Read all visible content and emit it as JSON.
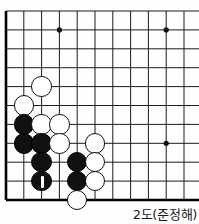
{
  "diagram": {
    "kind": "go-board-problem-diagram",
    "caption": "2도(준정해)",
    "board": {
      "size": 19,
      "visible_columns": 11,
      "visible_rows": 11,
      "origin": "top-left-corner-of-board",
      "edges": [
        "left",
        "bottom"
      ],
      "line_color": "#1a1a1a",
      "edge_color": "#000000",
      "background_color": "#fefefe",
      "geometry": {
        "left_edge_x": 6,
        "top_line_y": 11,
        "col_spacing": 17.8,
        "row_spacing": 18.9,
        "stone_diameter": 20.5
      },
      "star_points": [
        {
          "col": 4,
          "row": 2
        },
        {
          "col": 10,
          "row": 2
        },
        {
          "col": 10,
          "row": 8
        }
      ]
    },
    "stones": [
      {
        "color": "white",
        "col": 3,
        "row": 5,
        "label": ""
      },
      {
        "color": "white",
        "col": 2,
        "row": 6,
        "label": ""
      },
      {
        "color": "black",
        "col": 2,
        "row": 7,
        "label": ""
      },
      {
        "color": "white",
        "col": 3,
        "row": 7,
        "label": ""
      },
      {
        "color": "white",
        "col": 4,
        "row": 7,
        "label": ""
      },
      {
        "color": "black",
        "col": 2,
        "row": 8,
        "label": ""
      },
      {
        "color": "black",
        "col": 3,
        "row": 8,
        "label": ""
      },
      {
        "color": "white",
        "col": 4,
        "row": 8,
        "label": ""
      },
      {
        "color": "white",
        "col": 6,
        "row": 8,
        "label": ""
      },
      {
        "color": "black",
        "col": 3,
        "row": 9,
        "label": ""
      },
      {
        "color": "black",
        "col": 5,
        "row": 9,
        "label": ""
      },
      {
        "color": "white",
        "col": 6,
        "row": 9,
        "label": ""
      },
      {
        "color": "black",
        "col": 3,
        "row": 10,
        "label": "1"
      },
      {
        "color": "black",
        "col": 5,
        "row": 10,
        "label": ""
      },
      {
        "color": "white",
        "col": 6,
        "row": 10,
        "label": ""
      },
      {
        "color": "white",
        "col": 5,
        "row": 11,
        "label": ""
      }
    ],
    "marked_move": {
      "number": "1",
      "color": "black",
      "col": 3,
      "row": 10,
      "marker_style": "vertical-white-bar"
    }
  }
}
